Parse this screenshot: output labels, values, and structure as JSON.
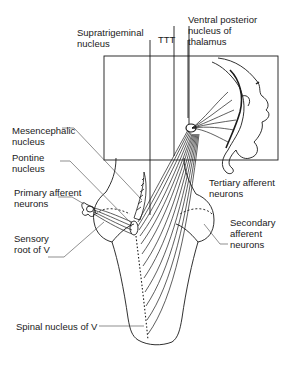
{
  "diagram": {
    "colors": {
      "ink": "#1a1a1a",
      "background": "#ffffff",
      "leader": "#444444"
    },
    "labels": {
      "supratrigeminal": "Supratrigeminal\nnucleus",
      "ttt": "TTT",
      "vpn": "Ventral posterior\nnucleus of\nthalamus",
      "mesencephalic": "Mesencephalic\nnucleus",
      "pontine": "Pontine\nnucleus",
      "primary": "Primary afferent\nneurons",
      "tertiary": "Tertiary afferent\nneurons",
      "secondary": "Secondary\nafferent\nneurons",
      "sensory_root": "Sensory\nroot of V",
      "spinal": "Spinal nucleus of V"
    }
  }
}
